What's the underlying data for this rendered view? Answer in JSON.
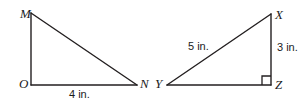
{
  "figure": {
    "type": "geometry-diagram",
    "background_color": "#ffffff",
    "stroke_color": "#231f20",
    "text_color": "#1b1b1b",
    "stroke_width": 1.4,
    "triangles": [
      {
        "name": "triangle-mon",
        "vertices": [
          {
            "label": "M",
            "x": 31,
            "y": 13
          },
          {
            "label": "O",
            "x": 31,
            "y": 85
          },
          {
            "label": "N",
            "x": 137,
            "y": 85
          }
        ],
        "right_angle_at": "O",
        "right_angle_marked": false,
        "side_labels": [
          {
            "label": "4 in.",
            "side": "ON",
            "value": 4,
            "unit": "in."
          }
        ]
      },
      {
        "name": "triangle-xyz",
        "vertices": [
          {
            "label": "X",
            "x": 271,
            "y": 14
          },
          {
            "label": "Y",
            "x": 167,
            "y": 85
          },
          {
            "label": "Z",
            "x": 271,
            "y": 85
          }
        ],
        "right_angle_at": "Z",
        "right_angle_marked": true,
        "side_labels": [
          {
            "label": "5 in.",
            "side": "XY",
            "value": 5,
            "unit": "in."
          },
          {
            "label": "3 in.",
            "side": "XZ",
            "value": 3,
            "unit": "in."
          }
        ]
      }
    ]
  },
  "labels": {
    "m": "M",
    "o": "O",
    "n": "N",
    "x": "X",
    "y": "Y",
    "z": "Z",
    "four_in": "4 in.",
    "five_in": "5 in.",
    "three_in": "3 in."
  }
}
